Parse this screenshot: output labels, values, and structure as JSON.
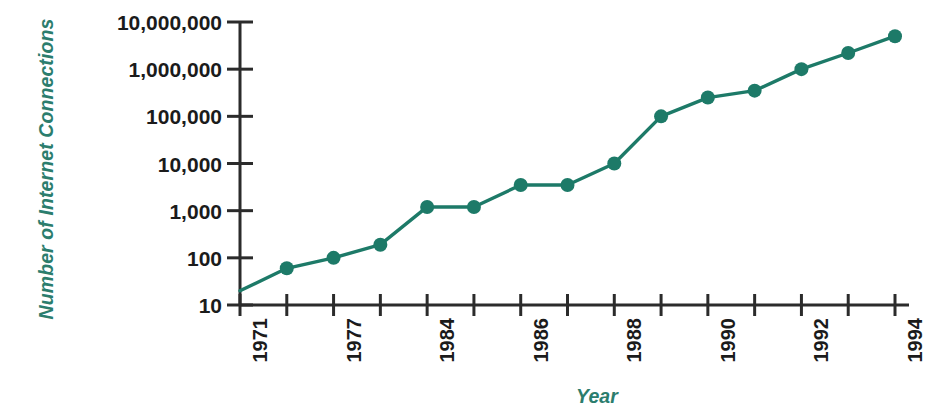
{
  "chart_data": {
    "type": "line",
    "title": "",
    "xlabel": "Year",
    "ylabel": "Number of Internet Connections",
    "yscale": "log",
    "ylim": [
      10,
      10000000
    ],
    "xlim": [
      1971,
      1994
    ],
    "grid": false,
    "legend": null,
    "y_tick_labels": [
      "10,000,000",
      "1,000,000",
      "100,000",
      "10,000",
      "1,000",
      "100",
      "10"
    ],
    "y_tick_values": [
      10000000,
      1000000,
      100000,
      10000,
      1000,
      100,
      10
    ],
    "x_tick_values": [
      1971,
      1974,
      1977,
      1980,
      1984,
      1985,
      1986,
      1987,
      1988,
      1989,
      1990,
      1991,
      1992,
      1993,
      1994
    ],
    "x_tick_labels": [
      "1971",
      "",
      "1977",
      "",
      "1984",
      "",
      "1986",
      "",
      "1988",
      "",
      "1990",
      "",
      "1992",
      "",
      "1994"
    ],
    "series": [
      {
        "name": "Internet connections",
        "color": "#1d7a68",
        "marker": "circle",
        "x": [
          1971,
          1974,
          1977,
          1980,
          1984,
          1985,
          1986,
          1987,
          1988,
          1989,
          1990,
          1991,
          1992,
          1993,
          1994
        ],
        "values": [
          20,
          60,
          100,
          190,
          1200,
          1200,
          3500,
          3500,
          10000,
          100000,
          250000,
          350000,
          1000000,
          2200000,
          5000000
        ],
        "marker_at_first_point": false
      }
    ]
  },
  "axis": {
    "y_title": "Number of Internet Connections",
    "x_title": "Year",
    "accent_color": "#2b7d6d",
    "axis_color": "#2b2b2b"
  }
}
